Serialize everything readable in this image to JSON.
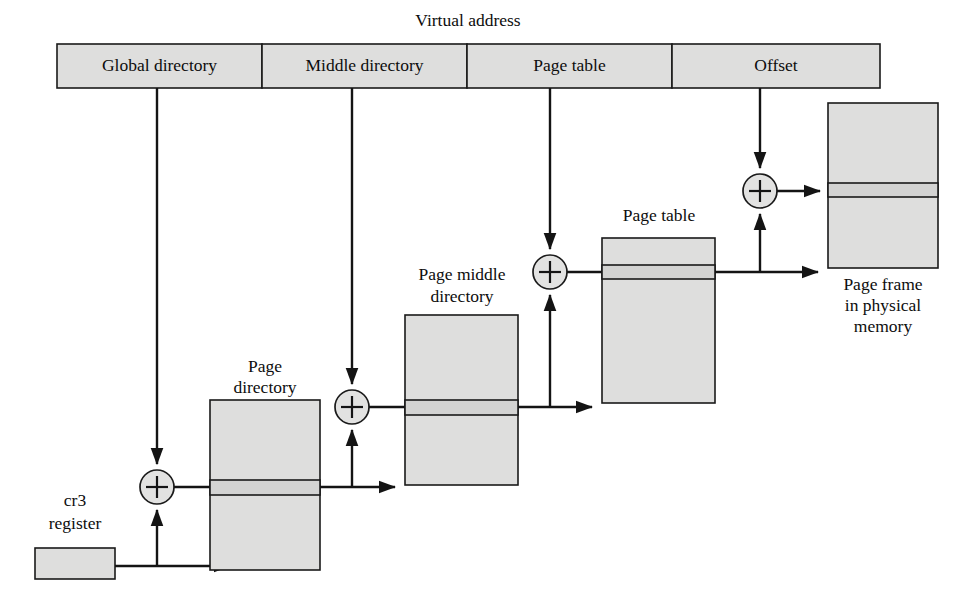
{
  "diagram": {
    "title": "Virtual address",
    "virtual_address": {
      "name": "virtual-address-bar",
      "segments": [
        {
          "label": "Global directory",
          "x": 57,
          "width": 205
        },
        {
          "label": "Middle directory",
          "x": 262,
          "width": 205
        },
        {
          "label": "Page table",
          "x": 467,
          "width": 205
        },
        {
          "label": "Offset",
          "x": 672,
          "width": 208
        }
      ],
      "y": 44,
      "height": 44
    },
    "registers": {
      "cr3_label_line1": "cr3",
      "cr3_label_line2": "register"
    },
    "tables": [
      {
        "id": "page-directory",
        "label_line1": "Page",
        "label_line2": "directory",
        "x": 210,
        "y": 400,
        "width": 110,
        "height": 170,
        "highlight_y": 480,
        "highlight_height": 15
      },
      {
        "id": "page-middle-directory",
        "label_line1": "Page middle",
        "label_line2": "directory",
        "x": 405,
        "y": 315,
        "width": 113,
        "height": 170,
        "highlight_y": 400,
        "highlight_height": 15
      },
      {
        "id": "page-table",
        "label_line1": "Page table",
        "label_line2": "",
        "x": 602,
        "y": 238,
        "width": 113,
        "height": 165,
        "highlight_y": 265,
        "highlight_height": 14
      },
      {
        "id": "page-frame",
        "label_line1": "Page frame",
        "label_line2": "in physical",
        "label_line3": "memory",
        "x": 828,
        "y": 103,
        "width": 110,
        "height": 165,
        "highlight_y": 183,
        "highlight_height": 14
      }
    ],
    "adders": [
      {
        "id": "adder-1",
        "cx": 157,
        "cy": 487,
        "r": 17,
        "symbol": "+"
      },
      {
        "id": "adder-2",
        "cx": 352,
        "cy": 407,
        "r": 17,
        "symbol": "+"
      },
      {
        "id": "adder-3",
        "cx": 550,
        "cy": 272,
        "r": 17,
        "symbol": "+"
      },
      {
        "id": "adder-4",
        "cx": 760,
        "cy": 191,
        "r": 17,
        "symbol": "+"
      }
    ],
    "colors": {
      "box_fill": "#dededd",
      "row_highlight": "#d3d3d2",
      "line": "#141414",
      "text": "#0d0d0d",
      "background": "#ffffff"
    }
  }
}
